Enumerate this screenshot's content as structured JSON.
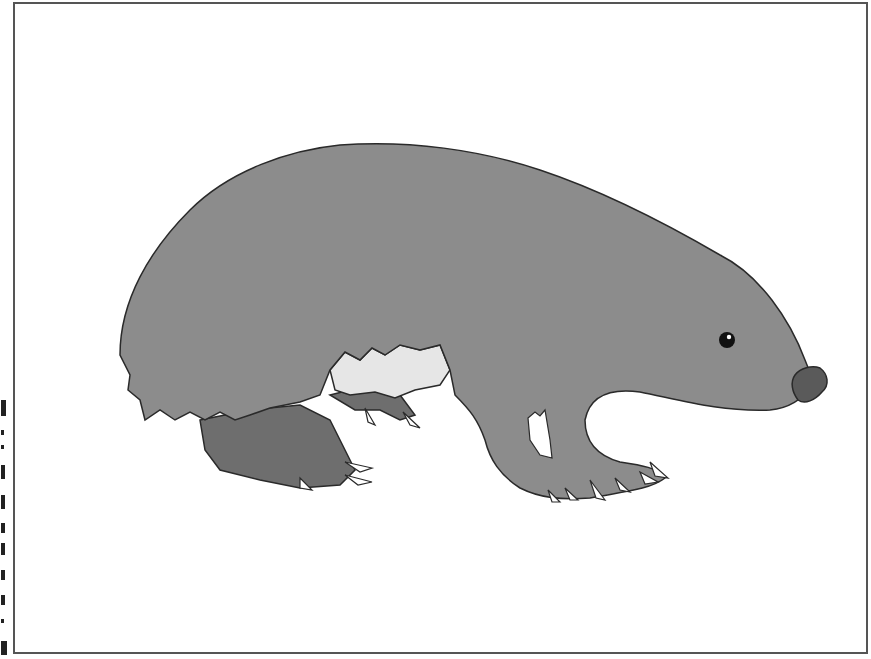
{
  "figure": {
    "colors": {
      "body": "#8c8c8c",
      "legs": "#6e6e6e",
      "belly": "#e6e6e6",
      "nose": "#5a5a5a",
      "claws": "#ffffff",
      "outline": "#2a2a2a",
      "border": "#555555"
    }
  }
}
